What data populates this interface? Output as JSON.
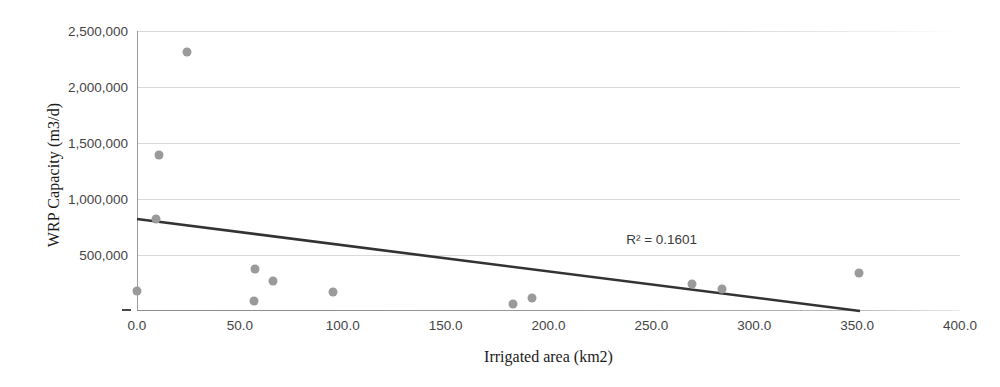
{
  "chart_data": {
    "type": "scatter",
    "title": "",
    "xlabel": "Irrigated area (km2)",
    "ylabel": "WRP Capacity (m3/d)",
    "xlim": [
      0,
      400
    ],
    "ylim": [
      0,
      2500000
    ],
    "xticks": [
      "0.0",
      "50.0",
      "100.0",
      "150.0",
      "200.0",
      "250.0",
      "300.0",
      "350.0",
      "400.0"
    ],
    "xtick_values": [
      0,
      50,
      100,
      150,
      200,
      250,
      300,
      350,
      400
    ],
    "yticks": [
      "-",
      "500,000",
      "1,000,000",
      "1,500,000",
      "2,000,000",
      "2,500,000"
    ],
    "ytick_values": [
      0,
      500000,
      1000000,
      1500000,
      2000000,
      2500000
    ],
    "grid": true,
    "legend": false,
    "marker_color": "#9a9a9a",
    "trendline_color": "#333333",
    "gridline_color": "#d9d9d9",
    "points": [
      {
        "x": 0.0,
        "y": 178000
      },
      {
        "x": 9.2,
        "y": 821000
      },
      {
        "x": 10.5,
        "y": 1393000
      },
      {
        "x": 24.3,
        "y": 2312000
      },
      {
        "x": 56.9,
        "y": 89000
      },
      {
        "x": 57.4,
        "y": 375000
      },
      {
        "x": 66.1,
        "y": 268000
      },
      {
        "x": 95.3,
        "y": 170000
      },
      {
        "x": 182.7,
        "y": 62000
      },
      {
        "x": 192.0,
        "y": 116000
      },
      {
        "x": 269.7,
        "y": 241000
      },
      {
        "x": 284.3,
        "y": 196000
      },
      {
        "x": 350.9,
        "y": 339000
      }
    ],
    "trendline": {
      "x_start": 0.0,
      "y_start": 821000,
      "x_end": 351.4,
      "y_end": 0
    },
    "annotations": [
      {
        "name": "r-squared",
        "text": "R² = 0.1601",
        "x": 255.0,
        "y": 640000
      }
    ]
  }
}
